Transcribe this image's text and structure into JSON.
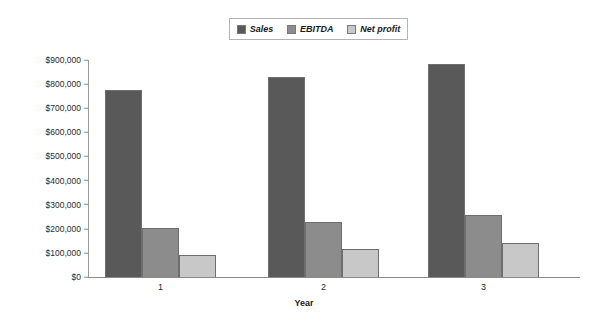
{
  "chart_data": {
    "type": "bar",
    "title": "",
    "subtitle": "",
    "xlabel": "Year",
    "ylabel": "",
    "categories": [
      "1",
      "2",
      "3"
    ],
    "series": [
      {
        "name": "Sales",
        "color": "#595959",
        "values": [
          775000,
          830000,
          885000
        ]
      },
      {
        "name": "EBITDA",
        "color": "#8c8c8c",
        "values": [
          205000,
          230000,
          258000
        ]
      },
      {
        "name": "Net profit",
        "color": "#c8c8c8",
        "values": [
          92000,
          118000,
          142000
        ]
      }
    ],
    "ylim": [
      0,
      900000
    ],
    "ytick_labels": [
      "$900,000",
      "$800,000",
      "$700,000",
      "$600,000",
      "$500,000",
      "$400,000",
      "$300,000",
      "$200,000",
      "$100,000",
      "$0"
    ],
    "ytick_values": [
      900000,
      800000,
      700000,
      600000,
      500000,
      400000,
      300000,
      200000,
      100000,
      0
    ],
    "grid": false,
    "legend_position": "top-center",
    "bar_border_color": "#6e6e6e",
    "axis_color": "#8a8a8a",
    "background_color": "#ffffff"
  },
  "legend": {
    "items": [
      {
        "label": "Sales"
      },
      {
        "label": "EBITDA"
      },
      {
        "label": "Net profit"
      }
    ]
  }
}
